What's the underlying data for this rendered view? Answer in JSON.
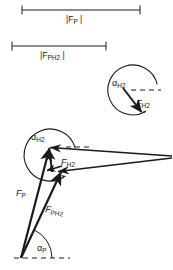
{
  "figure": {
    "type": "vector-force-diagram",
    "background_color": "#ffffff",
    "stroke_color": "#1a1a1a",
    "scale_bars": [
      {
        "id": "scale-bar-fp",
        "label_base": "|F",
        "label_sub": "P",
        "label_tail": " |",
        "label_full": "|F_P|",
        "x_start": 22,
        "x_end": 140,
        "y": 10,
        "text_x": 66,
        "text_y": 15
      },
      {
        "id": "scale-bar-fph2",
        "label_base": "|F",
        "label_sub": "PH2",
        "label_tail": " |",
        "label_full": "|F_PH2|",
        "x_start": 12,
        "x_end": 106,
        "y": 46,
        "text_x": 40,
        "text_y": 51
      }
    ],
    "inset_angle_diagram": {
      "id": "inset-alpha-h2",
      "angle_label_base": "α",
      "angle_label_sub": "H2",
      "angle_label_full": "alpha_H2",
      "vector_label_base": "F",
      "vector_label_sub": "H2",
      "vector_label_full": "F_H2",
      "center_x": 133,
      "center_y": 90,
      "radius": 25,
      "reference_line": "dashed-horizontal",
      "vector_direction_deg": -62
    },
    "main_diagram": {
      "id": "main-vector-diagram",
      "origin_x": 21,
      "origin_y": 258,
      "angle_label_base": "α",
      "angle_label_sub": "P",
      "angle_label_full": "alpha_P",
      "angle_arc_radius": 31,
      "big_angle_label_base": "α",
      "big_angle_label_sub": "H2",
      "big_angle_label_full": "alpha_H2",
      "big_arc_center_x": 52,
      "big_arc_center_y": 154,
      "big_arc_radius": 26,
      "vectors": [
        {
          "name": "F_P",
          "label_base": "F",
          "label_sub": "P",
          "text_x": 16,
          "text_y": 189
        },
        {
          "name": "F_PH2",
          "label_base": "F",
          "label_sub": "PH2",
          "text_x": 46,
          "text_y": 205
        },
        {
          "name": "F_H2",
          "label_base": "F",
          "label_sub": "H2",
          "text_x": 61,
          "text_y": 158
        }
      ],
      "reference_line": "dashed-horizontal"
    }
  }
}
